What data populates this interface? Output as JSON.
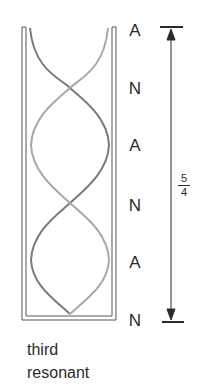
{
  "diagram": {
    "caption": {
      "line1": "third",
      "line2": "resonant"
    },
    "node_labels": [
      {
        "label": "A",
        "y": 22
      },
      {
        "label": "N",
        "y": 80
      },
      {
        "label": "A",
        "y": 137
      },
      {
        "label": "N",
        "y": 197
      },
      {
        "label": "A",
        "y": 254
      },
      {
        "label": "N",
        "y": 312
      }
    ],
    "length_annotation": {
      "numerator": "5",
      "denominator": "4",
      "meaning": "5/4 wavelength"
    },
    "colors": {
      "tube": "#555555",
      "wave_dark": "#7a7a7a",
      "wave_light": "#a8a8a8",
      "text": "#2a2a2a"
    }
  }
}
